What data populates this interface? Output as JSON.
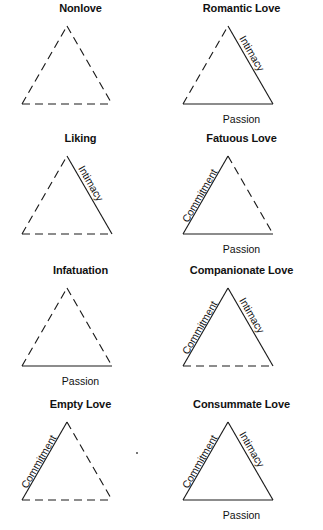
{
  "figure": {
    "columns": 2,
    "rows": 4,
    "line_color": "#1a1a1a",
    "text_color": "#111111",
    "background_color": "#ffffff",
    "component_labels": {
      "intimacy": "Intimacy",
      "passion": "Passion",
      "commitment": "Commitment"
    }
  },
  "triangles": [
    {
      "title": "Nonlove",
      "intimacy": {
        "label": "Intimacy",
        "present": false
      },
      "passion": {
        "label": "Passion",
        "present": false
      },
      "commitment": {
        "label": "Commitment",
        "present": false
      }
    },
    {
      "title": "Romantic Love",
      "intimacy": {
        "label": "Intimacy",
        "present": true
      },
      "passion": {
        "label": "Passion",
        "present": true
      },
      "commitment": {
        "label": "Commitment",
        "present": false
      }
    },
    {
      "title": "Liking",
      "intimacy": {
        "label": "Intimacy",
        "present": true
      },
      "passion": {
        "label": "Passion",
        "present": false
      },
      "commitment": {
        "label": "Commitment",
        "present": false
      }
    },
    {
      "title": "Fatuous Love",
      "intimacy": {
        "label": "Intimacy",
        "present": false
      },
      "passion": {
        "label": "Passion",
        "present": true
      },
      "commitment": {
        "label": "Commitment",
        "present": true
      }
    },
    {
      "title": "Infatuation",
      "intimacy": {
        "label": "Intimacy",
        "present": false
      },
      "passion": {
        "label": "Passion",
        "present": true
      },
      "commitment": {
        "label": "Commitment",
        "present": false
      }
    },
    {
      "title": "Companionate Love",
      "intimacy": {
        "label": "Intimacy",
        "present": true
      },
      "passion": {
        "label": "Passion",
        "present": false
      },
      "commitment": {
        "label": "Commitment",
        "present": true
      }
    },
    {
      "title": "Empty Love",
      "intimacy": {
        "label": "Intimacy",
        "present": false
      },
      "passion": {
        "label": "Passion",
        "present": false
      },
      "commitment": {
        "label": "Commitment",
        "present": true
      }
    },
    {
      "title": "Consummate Love",
      "intimacy": {
        "label": "Intimacy",
        "present": true
      },
      "passion": {
        "label": "Passion",
        "present": true
      },
      "commitment": {
        "label": "Commitment",
        "present": true
      }
    }
  ]
}
